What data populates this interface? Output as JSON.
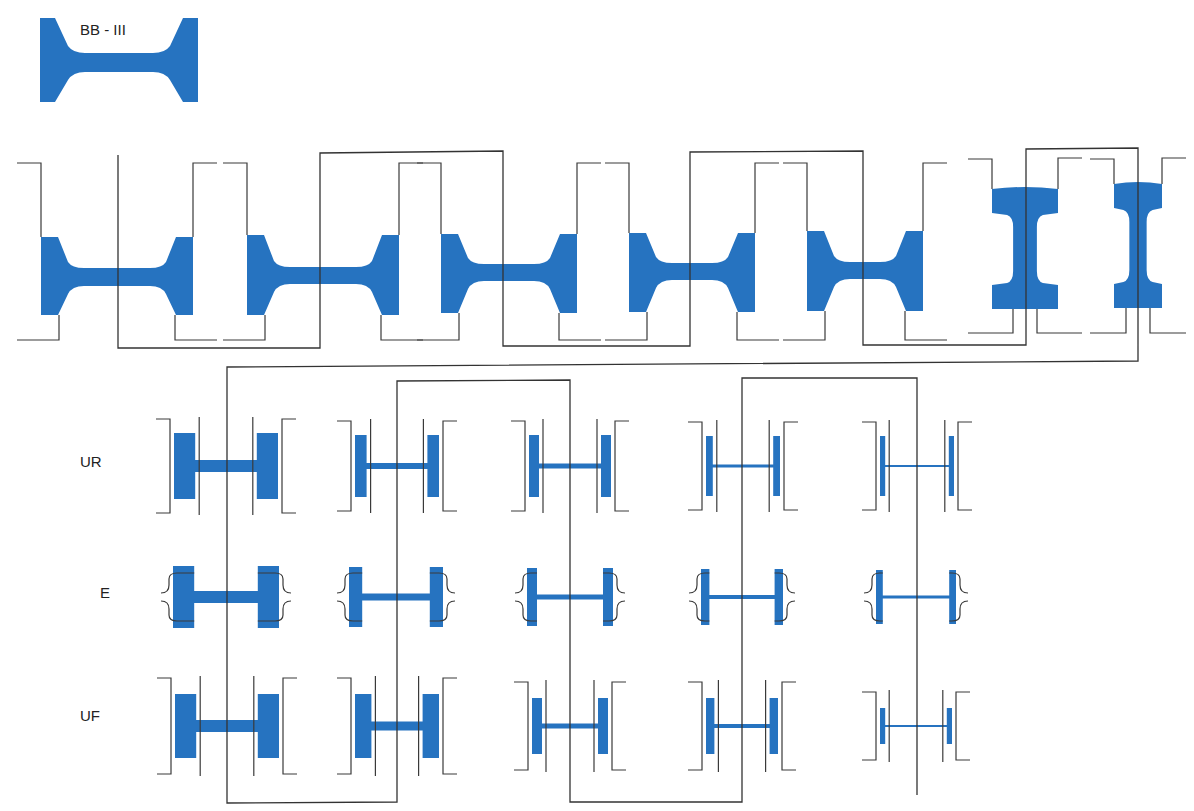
{
  "title_block": {
    "label": "BB - III",
    "x": 40,
    "y": 18,
    "w": 158,
    "h": 84
  },
  "colors": {
    "profile_fill": "#2673c0",
    "line": "#333333",
    "background": "#ffffff"
  },
  "row_labels": [
    {
      "id": "ur",
      "text": "UR",
      "x": 80,
      "y": 462
    },
    {
      "id": "e",
      "text": "E",
      "x": 100,
      "y": 593
    },
    {
      "id": "uf",
      "text": "UF",
      "x": 80,
      "y": 716
    }
  ],
  "breakdown_passes": [
    {
      "cx": 117,
      "w": 152,
      "flange_top": 237,
      "flange_bot": 315,
      "web_top": 268,
      "web_bot": 286,
      "type": "h"
    },
    {
      "cx": 323,
      "w": 152,
      "flange_top": 235,
      "flange_bot": 315,
      "web_top": 267,
      "web_bot": 284,
      "type": "h"
    },
    {
      "cx": 509,
      "w": 136,
      "flange_top": 234,
      "flange_bot": 313,
      "web_top": 264,
      "web_bot": 281,
      "type": "h"
    },
    {
      "cx": 692,
      "w": 126,
      "flange_top": 233,
      "flange_bot": 312,
      "web_top": 263,
      "web_bot": 280,
      "type": "h"
    },
    {
      "cx": 865,
      "w": 116,
      "flange_top": 231,
      "flange_bot": 311,
      "web_top": 262,
      "web_bot": 279,
      "type": "h"
    },
    {
      "cx": 1025,
      "w": 66,
      "top": 189,
      "bot": 309,
      "type": "i"
    },
    {
      "cx": 1138,
      "w": 48,
      "top": 184,
      "bot": 308,
      "type": "i"
    }
  ],
  "universal_rows": {
    "ur": {
      "cy": 466,
      "passes": [
        {
          "cx": 226,
          "w": 104,
          "fh": 50,
          "web": 12
        },
        {
          "cx": 397,
          "w": 84,
          "fh": 46,
          "web": 6
        },
        {
          "cx": 570,
          "w": 82,
          "fh": 46,
          "web": 5
        },
        {
          "cx": 743,
          "w": 74,
          "fh": 44,
          "web": 3
        },
        {
          "cx": 917,
          "w": 74,
          "fh": 44,
          "web": 2
        }
      ]
    },
    "e": {
      "cy": 597,
      "passes": [
        {
          "cx": 226,
          "w": 106,
          "fh": 46,
          "web": 12
        },
        {
          "cx": 396,
          "w": 94,
          "fh": 44,
          "web": 7
        },
        {
          "cx": 570,
          "w": 86,
          "fh": 42,
          "web": 5
        },
        {
          "cx": 742,
          "w": 82,
          "fh": 40,
          "web": 4
        },
        {
          "cx": 916,
          "w": 80,
          "fh": 38,
          "web": 3
        }
      ]
    },
    "uf": {
      "cy": 726,
      "passes": [
        {
          "cx": 227,
          "w": 104,
          "fh": 48,
          "web": 12
        },
        {
          "cx": 397,
          "w": 84,
          "fh": 48,
          "web": 9
        },
        {
          "cx": 570,
          "w": 76,
          "fh": 40,
          "web": 5
        },
        {
          "cx": 742,
          "w": 72,
          "fh": 40,
          "web": 4
        },
        {
          "cx": 916,
          "w": 72,
          "fh": 20,
          "web": 2
        }
      ]
    }
  },
  "flow_lines": [
    "M118,155 L118,348 L320,348 L320,153 L503,151 L503,346 L690,346 L690,152 L863,151 L863,345 L1026,345 L1026,149 L1138,148 L1138,361 L227,367 L227,803 L397,802 L397,381 L570,380 L570,802 L742,802 L742,378 L917,378 L917,795"
  ]
}
